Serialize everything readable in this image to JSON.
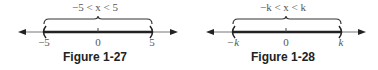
{
  "figures": [
    {
      "caption": "Figure 1-27",
      "inequality": "−5 < x < 5",
      "left_label": "−5",
      "center_label": "0",
      "right_label": "5",
      "endpoint_style": "open-parenthesis"
    },
    {
      "caption": "Figure 1-28",
      "inequality": "−k < x < k",
      "left_label": "−k",
      "center_label": "0",
      "right_label": "k",
      "endpoint_style": "open-parenthesis"
    }
  ],
  "colors": {
    "axis": "#666666",
    "interval": "#222222",
    "text": "#555555",
    "caption": "#222222"
  }
}
